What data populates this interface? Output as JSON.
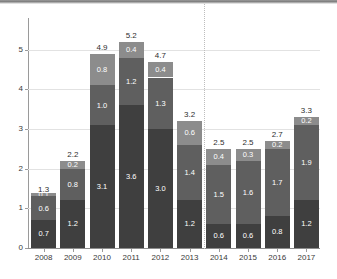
{
  "chart_data": {
    "type": "bar",
    "stacked": true,
    "title": "",
    "subtitle": "",
    "xlabel": "",
    "ylabel": "",
    "categories": [
      "2008",
      "2009",
      "2010",
      "2011",
      "2012",
      "2013",
      "2014",
      "2015",
      "2016",
      "2017"
    ],
    "series": [
      {
        "name": "segment-bottom",
        "color": "#3f3f3f",
        "values": [
          0.7,
          1.2,
          3.1,
          3.6,
          3.0,
          1.2,
          0.6,
          0.6,
          0.8,
          1.2
        ]
      },
      {
        "name": "segment-middle",
        "color": "#5f5f5f",
        "values": [
          0.6,
          0.8,
          1.0,
          1.2,
          1.3,
          1.4,
          1.5,
          1.6,
          1.7,
          1.9
        ]
      },
      {
        "name": "segment-top",
        "color": "#8c8c8c",
        "values": [
          0.1,
          0.2,
          0.8,
          0.4,
          0.4,
          0.6,
          0.4,
          0.3,
          0.2,
          0.2
        ]
      }
    ],
    "segment_labels": [
      [
        "0.7",
        "0.6",
        "0.1"
      ],
      [
        "1.2",
        "0.8",
        "0.2"
      ],
      [
        "3.1",
        "1.0",
        "0.8"
      ],
      [
        "3.6",
        "1.2",
        "0.4"
      ],
      [
        "3.0",
        "1.3",
        "0.4"
      ],
      [
        "1.2",
        "1.4",
        "0.6"
      ],
      [
        "0.6",
        "1.5",
        "0.4"
      ],
      [
        "0.6",
        "1.6",
        "0.3"
      ],
      [
        "0.8",
        "1.7",
        "0.2"
      ],
      [
        "1.2",
        "1.9",
        "0.2"
      ]
    ],
    "totals": [
      "1.3",
      "2.2",
      "4.9",
      "5.2",
      "4.7",
      "3.2",
      "2.5",
      "2.5",
      "2.7",
      "3.3"
    ],
    "total_values": [
      1.3,
      2.2,
      4.9,
      5.2,
      4.7,
      3.2,
      2.5,
      2.5,
      2.7,
      3.3
    ],
    "ylim": [
      0,
      5.8
    ],
    "yticks": [
      0,
      1,
      2,
      3,
      4,
      5
    ],
    "ytick_labels": [
      "0",
      "1",
      "2",
      "3",
      "4",
      "5"
    ],
    "grid": true,
    "legend": false,
    "annotations": [
      {
        "name": "forecast-divider",
        "type": "vertical-dotted-line",
        "after_category": "2013",
        "color": "#bdbdbd"
      }
    ]
  },
  "colors": {
    "segment_bottom": "#3f3f3f",
    "segment_middle": "#5f5f5f",
    "segment_top": "#8c8c8c",
    "gridline": "#e2e2e2",
    "axis": "#9a9a9a",
    "divider": "#bdbdbd",
    "label_outside": "#2e2e2e",
    "label_inside": "#ffffff"
  }
}
